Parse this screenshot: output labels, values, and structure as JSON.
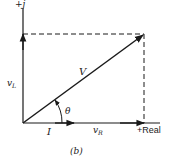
{
  "figure": {
    "caption": "(b)",
    "axes": {
      "imag_label": "+j",
      "real_label": "+Real"
    },
    "phasors": {
      "resultant": "V",
      "current": "I",
      "inductor_voltage": {
        "base": "v",
        "sub": "L"
      },
      "resistor_voltage": {
        "base": "v",
        "sub": "R"
      }
    },
    "angle_label": "θ",
    "colors": {
      "ink": "#1a1a1a",
      "background": "#ffffff"
    }
  }
}
